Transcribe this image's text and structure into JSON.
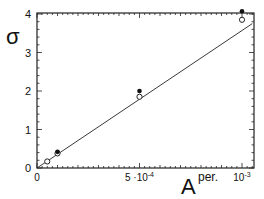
{
  "chart_data": {
    "type": "scatter",
    "title": "",
    "xlabel": "A",
    "xlabel_superscript": "per.",
    "ylabel": "σ",
    "xlim": [
      0,
      0.00105
    ],
    "ylim": [
      0,
      4.05
    ],
    "x_ticks": [
      {
        "value": 0,
        "label": "0"
      },
      {
        "value": 0.0005,
        "label": "5 ·10",
        "exp": "-4"
      },
      {
        "value": 0.001,
        "label": "10",
        "exp": "-3"
      }
    ],
    "y_ticks": [
      {
        "value": 0,
        "label": "0"
      },
      {
        "value": 1,
        "label": "1"
      },
      {
        "value": 2,
        "label": "2"
      },
      {
        "value": 3,
        "label": "3"
      },
      {
        "value": 4,
        "label": "4"
      }
    ],
    "grid": false,
    "legend": null,
    "series": [
      {
        "name": "open circles",
        "marker": "open-circle",
        "points": [
          {
            "x": 5e-05,
            "y": 0.17
          },
          {
            "x": 0.0001,
            "y": 0.38
          },
          {
            "x": 0.0005,
            "y": 1.85
          },
          {
            "x": 0.001,
            "y": 3.85
          }
        ]
      },
      {
        "name": "filled circles",
        "marker": "filled-circle",
        "points": [
          {
            "x": 0.0001,
            "y": 0.42
          },
          {
            "x": 0.0005,
            "y": 2.0
          },
          {
            "x": 0.001,
            "y": 4.07
          }
        ]
      },
      {
        "name": "linear fit",
        "marker": "line",
        "points": [
          {
            "x": 0,
            "y": 0
          },
          {
            "x": 0.00105,
            "y": 3.75
          }
        ]
      }
    ]
  }
}
